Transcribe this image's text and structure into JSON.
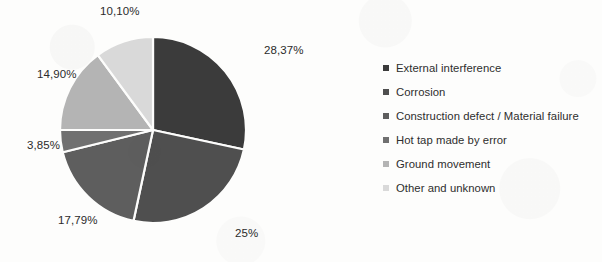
{
  "chart_data": {
    "type": "pie",
    "title": "",
    "subtitle": "",
    "xlabel": "",
    "ylabel": "",
    "grid": false,
    "legend_position": "right",
    "start_angle_deg": 0,
    "direction": "clockwise",
    "categories": [
      "External interference",
      "Corrosion",
      "Construction defect / Material failure",
      "Hot tap made by error",
      "Ground movement",
      "Other and unknown"
    ],
    "values": [
      28.37,
      25,
      17.79,
      3.85,
      14.9,
      10.1
    ],
    "value_labels": [
      "28,37%",
      "25%",
      "17,79%",
      "3,85%",
      "14,90%",
      "10,10%"
    ],
    "colors": [
      "#3b3b3b",
      "#4f4f4f",
      "#5e5e5e",
      "#707070",
      "#b4b4b4",
      "#d9d9d9"
    ],
    "slices": [
      {
        "category": "External interference",
        "value": 28.37,
        "label": "28,37%",
        "color": "#3b3b3b"
      },
      {
        "category": "Corrosion",
        "value": 25,
        "label": "25%",
        "color": "#4f4f4f"
      },
      {
        "category": "Construction defect / Material failure",
        "value": 17.79,
        "label": "17,79%",
        "color": "#5e5e5e"
      },
      {
        "category": "Hot tap made by error",
        "value": 3.85,
        "label": "3,85%",
        "color": "#707070"
      },
      {
        "category": "Ground movement",
        "value": 14.9,
        "label": "14,90%",
        "color": "#b4b4b4"
      },
      {
        "category": "Other and unknown",
        "value": 10.1,
        "label": "10,10%",
        "color": "#d9d9d9"
      }
    ]
  },
  "labels": {
    "l0": "28,37%",
    "l1": "25%",
    "l2": "17,79%",
    "l3": "3,85%",
    "l4": "14,90%",
    "l5": "10,10%"
  },
  "legend": {
    "items": [
      {
        "label": "External interference",
        "color": "#3b3b3b"
      },
      {
        "label": "Corrosion",
        "color": "#4f4f4f"
      },
      {
        "label": "Construction defect / Material failure",
        "color": "#5e5e5e"
      },
      {
        "label": "Hot tap made by error",
        "color": "#707070"
      },
      {
        "label": "Ground movement",
        "color": "#b4b4b4"
      },
      {
        "label": "Other and unknown",
        "color": "#d9d9d9"
      }
    ]
  }
}
